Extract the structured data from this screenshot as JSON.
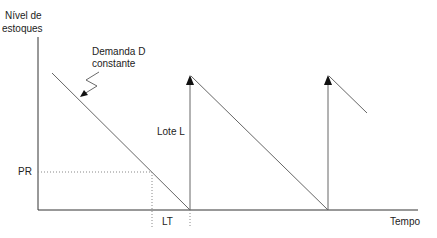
{
  "labels": {
    "y_axis_line1": "Nível de",
    "y_axis_line2": "estoques",
    "demand_line1": "Demanda D",
    "demand_line2": "constante",
    "lot": "Lote L",
    "reorder_point": "PR",
    "lead_time": "LT",
    "x_axis": "Tempo"
  },
  "colors": {
    "axis": "#333333",
    "line": "#555555",
    "dotted": "#888888"
  }
}
